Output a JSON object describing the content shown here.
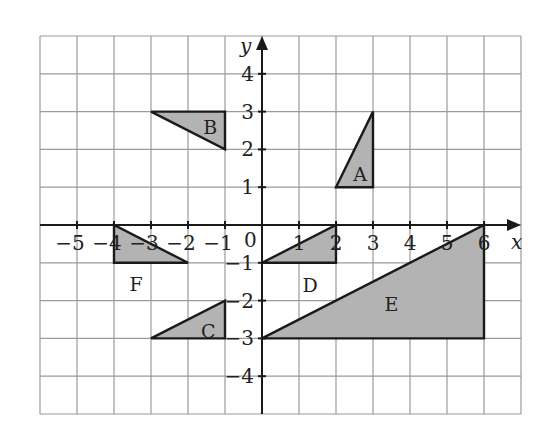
{
  "diagram": {
    "type": "coordinate-grid",
    "x_axis_label": "x",
    "y_axis_label": "y",
    "origin_label": "0",
    "grid": {
      "x_min": -6,
      "x_max": 7,
      "y_min": -5,
      "y_max": 5
    },
    "x_ticks": [
      {
        "v": -5,
        "label": "−5"
      },
      {
        "v": -4,
        "label": "−4"
      },
      {
        "v": -3,
        "label": "−3"
      },
      {
        "v": -2,
        "label": "−2"
      },
      {
        "v": -1,
        "label": "−1"
      },
      {
        "v": 1,
        "label": "1"
      },
      {
        "v": 2,
        "label": "2"
      },
      {
        "v": 3,
        "label": "3"
      },
      {
        "v": 4,
        "label": "4"
      },
      {
        "v": 5,
        "label": "5"
      },
      {
        "v": 6,
        "label": "6"
      }
    ],
    "y_ticks": [
      {
        "v": 4,
        "label": "4"
      },
      {
        "v": 3,
        "label": "3"
      },
      {
        "v": 2,
        "label": "2"
      },
      {
        "v": 1,
        "label": "1"
      },
      {
        "v": -1,
        "label": "−1"
      },
      {
        "v": -2,
        "label": "−2"
      },
      {
        "v": -3,
        "label": "−3"
      },
      {
        "v": -4,
        "label": "−4"
      }
    ],
    "shapes": [
      {
        "name": "A",
        "vertices": [
          [
            2,
            1
          ],
          [
            3,
            1
          ],
          [
            3,
            3
          ]
        ],
        "label_pos": [
          2.65,
          1.35
        ]
      },
      {
        "name": "B",
        "vertices": [
          [
            -3,
            3
          ],
          [
            -1,
            3
          ],
          [
            -1,
            2
          ]
        ],
        "label_pos": [
          -1.4,
          2.6
        ]
      },
      {
        "name": "C",
        "vertices": [
          [
            -3,
            -3
          ],
          [
            -1,
            -3
          ],
          [
            -1,
            -2
          ]
        ],
        "label_pos": [
          -1.45,
          -2.8
        ]
      },
      {
        "name": "D",
        "vertices": [
          [
            0,
            -1
          ],
          [
            2,
            -1
          ],
          [
            2,
            0
          ]
        ],
        "label_pos": [
          1.3,
          -1.6
        ]
      },
      {
        "name": "E",
        "vertices": [
          [
            0,
            -3
          ],
          [
            6,
            -3
          ],
          [
            6,
            0
          ]
        ],
        "label_pos": [
          3.5,
          -2.1
        ]
      },
      {
        "name": "F",
        "vertices": [
          [
            -4,
            0
          ],
          [
            -4,
            -1
          ],
          [
            -2,
            -1
          ]
        ],
        "label_pos": [
          -3.4,
          -1.55
        ]
      }
    ],
    "colors": {
      "fill": "#b3b3b3",
      "stroke": "#1a1a1a",
      "grid": "#9a9a9a"
    }
  }
}
